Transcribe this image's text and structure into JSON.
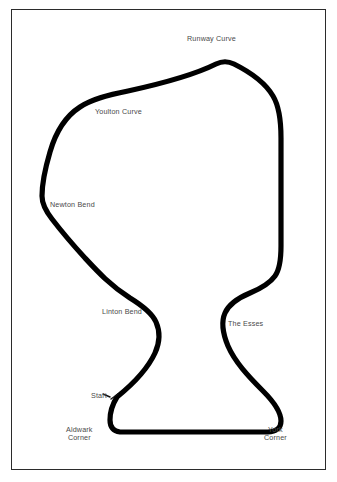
{
  "document": {
    "type": "circuit-map",
    "title": "Elvington Circuit Layout",
    "background_color": "#ffffff",
    "frame_color": "#2b2b2b",
    "track_color": "#000000",
    "label_color": "#4a4a4a"
  },
  "labels": {
    "runway_curve": "Runway Curve",
    "youlton_curve": "Youlton Curve",
    "newton_bend": "Newton Bend",
    "linton_bend": "Linton Bend",
    "the_esses": "The Esses",
    "start": "Start",
    "aldwark_corner": "Aldwark\nCorner",
    "york_corner": "York\nCorner"
  },
  "corners": [
    {
      "name": "Runway Curve",
      "label_x": 187,
      "label_y": 35,
      "track_x": 218,
      "track_y": 63
    },
    {
      "name": "Youlton Curve",
      "label_x": 95,
      "label_y": 108,
      "track_x": 92,
      "track_y": 88
    },
    {
      "name": "Newton Bend",
      "label_x": 50,
      "label_y": 201,
      "track_x": 42,
      "track_y": 198
    },
    {
      "name": "Linton Bend",
      "label_x": 102,
      "label_y": 308,
      "track_x": 158,
      "track_y": 307
    },
    {
      "name": "The Esses",
      "label_x": 228,
      "label_y": 320,
      "track_x": 222,
      "track_y": 311
    },
    {
      "name": "Start",
      "label_x": 91,
      "label_y": 392,
      "track_x": 117,
      "track_y": 397
    },
    {
      "name": "Aldwark Corner",
      "label_x": 66,
      "label_y": 426,
      "track_x": 113,
      "track_y": 428
    },
    {
      "name": "York Corner",
      "label_x": 264,
      "label_y": 426,
      "track_x": 272,
      "track_y": 424
    }
  ]
}
